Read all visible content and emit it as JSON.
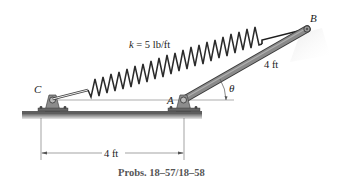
{
  "figure": {
    "caption": "Probs. 18–57/18–58",
    "spring_label": "k = 5 lb/ft",
    "spring_k_symbol": "k",
    "spring_k_value": " = 5 lb/ft",
    "bar_length_label": "4 ft",
    "horizontal_dimension_label": "4 ft",
    "angle_label": "θ",
    "points": {
      "C": "C",
      "A": "A",
      "B": "B"
    },
    "colors": {
      "bar": "#8a8a8a",
      "bar_edge": "#3a3a3a",
      "spring": "#2a2a2a",
      "ground": "#777777",
      "support": "#8c8c8c",
      "dimension": "#555555"
    }
  }
}
